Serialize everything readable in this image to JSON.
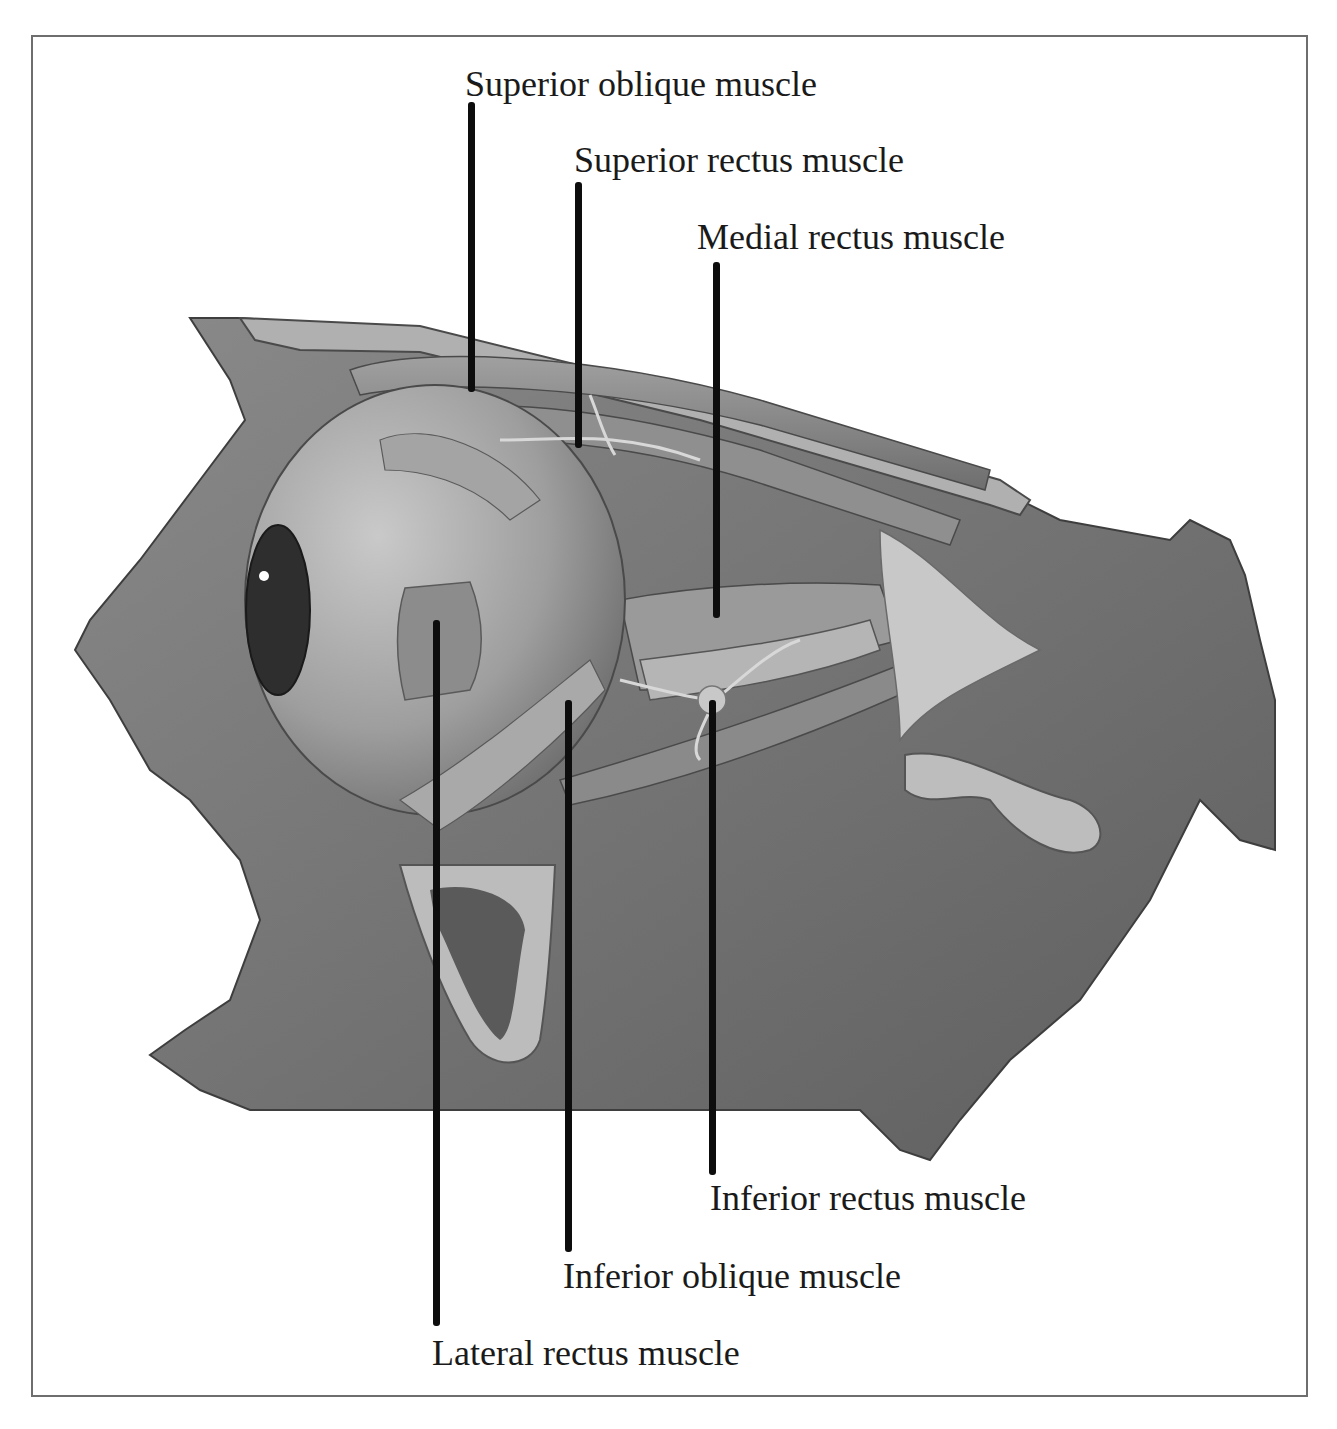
{
  "figure": {
    "colors": {
      "border": "#6e6e6e",
      "bone": "#7a7a7a",
      "bone_cut": "#b4b4b4",
      "muscle": "#8c8c8c",
      "eyeball": "#a8a8a8",
      "leader_line": "#0d0d0d",
      "text": "#1a1a1a"
    },
    "labels": [
      {
        "id": "superior-oblique",
        "text": "Superior oblique muscle",
        "x": 465,
        "y": 66,
        "line": {
          "x": 468,
          "top": 102,
          "bottom": 392
        }
      },
      {
        "id": "superior-rectus",
        "text": "Superior rectus muscle",
        "x": 574,
        "y": 142,
        "line": {
          "x": 575,
          "top": 182,
          "bottom": 448
        }
      },
      {
        "id": "medial-rectus",
        "text": "Medial rectus muscle",
        "x": 697,
        "y": 219,
        "line": {
          "x": 713,
          "top": 262,
          "bottom": 618
        }
      },
      {
        "id": "inferior-rectus",
        "text": "Inferior rectus muscle",
        "x": 710,
        "y": 1180,
        "line": {
          "x": 709,
          "top": 700,
          "bottom": 1175
        }
      },
      {
        "id": "inferior-oblique",
        "text": "Inferior oblique muscle",
        "x": 563,
        "y": 1258,
        "line": {
          "x": 565,
          "top": 700,
          "bottom": 1252
        }
      },
      {
        "id": "lateral-rectus",
        "text": "Lateral rectus muscle",
        "x": 432,
        "y": 1335,
        "line": {
          "x": 433,
          "top": 620,
          "bottom": 1326
        }
      }
    ]
  }
}
